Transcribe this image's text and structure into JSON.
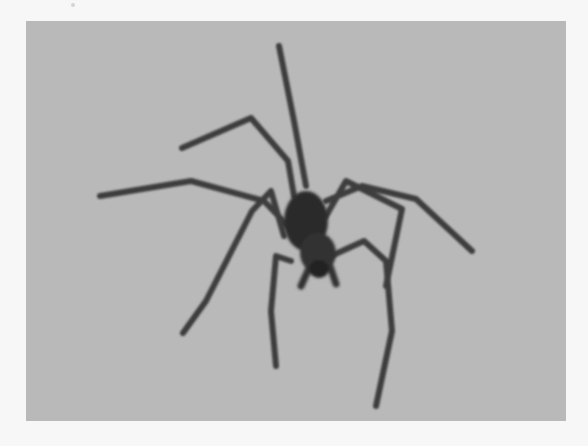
{
  "image": {
    "subject": "spider",
    "description": "Grayscale photograph of a long-legged spider on a plain gray background",
    "colors": {
      "page_background": "#f7f7f7",
      "photo_background": "#b9b9b9",
      "spider_body": "#2a2a2a",
      "spider_legs": "#3e3e3e"
    }
  }
}
